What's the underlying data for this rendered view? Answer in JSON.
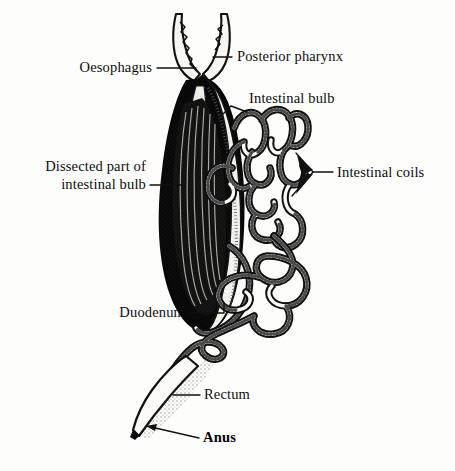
{
  "figure": {
    "background_color": "#fdfdfb",
    "ink_color": "#0d0d0d"
  },
  "labels": [
    {
      "id": "oesophagus",
      "text": "Oesophagus",
      "align": "right",
      "x": 152,
      "y": 72,
      "bold": false
    },
    {
      "id": "posterior-pharynx",
      "text": "Posterior pharynx",
      "align": "left",
      "x": 237,
      "y": 61,
      "bold": false
    },
    {
      "id": "intestinal-bulb",
      "text": "Intestinal bulb",
      "align": "left",
      "x": 249,
      "y": 103,
      "bold": false
    },
    {
      "id": "dissected-part-line1",
      "text": "Dissected part of",
      "align": "right",
      "x": 146,
      "y": 171,
      "bold": false
    },
    {
      "id": "dissected-part-line2",
      "text": "intestinal bulb",
      "align": "right",
      "x": 146,
      "y": 189,
      "bold": false
    },
    {
      "id": "intestinal-coils",
      "text": "Intestinal coils",
      "align": "left",
      "x": 337,
      "y": 177,
      "bold": false
    },
    {
      "id": "duodenum",
      "text": "Duodenum",
      "align": "right",
      "x": 185,
      "y": 317,
      "bold": false
    },
    {
      "id": "rectum",
      "text": "Rectum",
      "align": "left",
      "x": 204,
      "y": 399,
      "bold": false
    },
    {
      "id": "anus",
      "text": "Anus",
      "align": "left",
      "x": 203,
      "y": 442,
      "bold": true
    }
  ],
  "parts": [
    {
      "id": "posterior-pharynx",
      "name": "Posterior pharynx"
    },
    {
      "id": "oesophagus",
      "name": "Oesophagus"
    },
    {
      "id": "intestinal-bulb",
      "name": "Intestinal bulb"
    },
    {
      "id": "dissected-bulb",
      "name": "Dissected part of intestinal bulb"
    },
    {
      "id": "duodenum",
      "name": "Duodenum"
    },
    {
      "id": "intestinal-coils",
      "name": "Intestinal coils"
    },
    {
      "id": "rectum",
      "name": "Rectum"
    },
    {
      "id": "anus",
      "name": "Anus"
    }
  ]
}
